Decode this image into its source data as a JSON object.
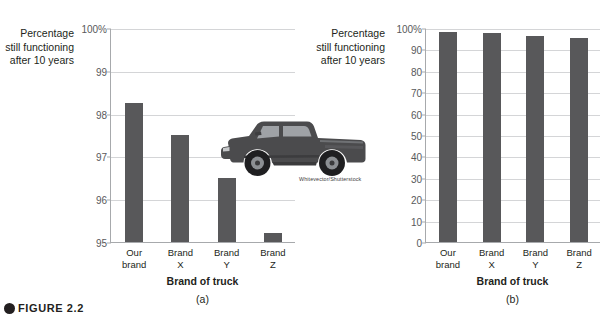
{
  "figure": {
    "caption_label": "FIGURE 2.2",
    "image_credit": "Whitevector/Shutterstock",
    "truck_icon": "pickup-truck-illustration"
  },
  "chart_data": [
    {
      "type": "bar",
      "panel_label": "(a)",
      "title": "",
      "ylabel": "Percentage still functioning after 10 years",
      "ylabel_lines": [
        "Percentage",
        "still functioning",
        "after 10 years"
      ],
      "xlabel": "Brand of truck",
      "categories": [
        "Our brand",
        "Brand X",
        "Brand Y",
        "Brand Z"
      ],
      "category_lines": [
        [
          "Our",
          "brand"
        ],
        [
          "Brand",
          "X"
        ],
        [
          "Brand",
          "Y"
        ],
        [
          "Brand",
          "Z"
        ]
      ],
      "values": [
        98.25,
        97.5,
        96.5,
        95.2
      ],
      "ylim": [
        95,
        100
      ],
      "yticks": [
        95,
        96,
        97,
        98,
        99,
        100
      ],
      "ytick_labels": [
        "95",
        "96",
        "97",
        "98",
        "99",
        "100%"
      ],
      "grid": true,
      "legend": "none",
      "bar_color": "#58585a",
      "grid_color": "#d4d5d7",
      "axis_color": "#a7a9ac"
    },
    {
      "type": "bar",
      "panel_label": "(b)",
      "title": "",
      "ylabel": "Percentage still functioning after 10 years",
      "ylabel_lines": [
        "Percentage",
        "still functioning",
        "after 10 years"
      ],
      "xlabel": "Brand of truck",
      "categories": [
        "Our brand",
        "Brand X",
        "Brand Y",
        "Brand Z"
      ],
      "category_lines": [
        [
          "Our",
          "brand"
        ],
        [
          "Brand",
          "X"
        ],
        [
          "Brand",
          "Y"
        ],
        [
          "Brand",
          "Z"
        ]
      ],
      "values": [
        98.25,
        97.5,
        96.5,
        95.2
      ],
      "ylim": [
        0,
        100
      ],
      "yticks": [
        0,
        10,
        20,
        30,
        40,
        50,
        60,
        70,
        80,
        90,
        100
      ],
      "ytick_labels": [
        "0",
        "10",
        "20",
        "30",
        "40",
        "50",
        "60",
        "70",
        "80",
        "90",
        "100%"
      ],
      "grid": true,
      "legend": "none",
      "bar_color": "#58585a",
      "grid_color": "#d4d5d7",
      "axis_color": "#a7a9ac"
    }
  ]
}
